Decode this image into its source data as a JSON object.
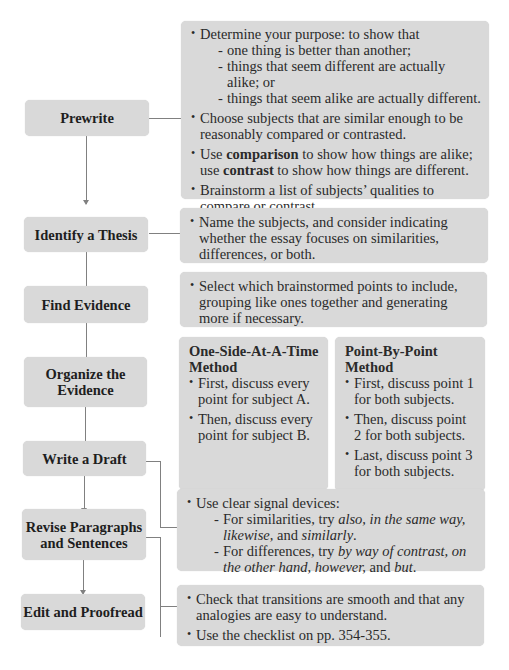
{
  "steps": [
    {
      "id": "prewrite",
      "label": "Prewrite"
    },
    {
      "id": "thesis",
      "label": "Identify a Thesis"
    },
    {
      "id": "evidence",
      "label": "Find Evidence"
    },
    {
      "id": "organize",
      "label_lines": [
        "Organize the",
        "Evidence"
      ]
    },
    {
      "id": "draft",
      "label": "Write a Draft"
    },
    {
      "id": "revise",
      "label_lines": [
        "Revise Paragraphs",
        "and Sentences"
      ]
    },
    {
      "id": "edit",
      "label": "Edit and Proofread"
    }
  ],
  "prewrite_panel": {
    "b1": "Determine your purpose: to show that",
    "b1_subs": [
      "one thing is better than another;",
      "things that seem different are actually alike; or",
      "things that seem alike are actually different."
    ],
    "b2": "Choose subjects that are similar enough to be reasonably compared or contrasted.",
    "b3_pre": "Use ",
    "b3_bold1": "comparison",
    "b3_mid": " to show how things are alike; use ",
    "b3_bold2": "contrast",
    "b3_post": " to show how things are different.",
    "b4": "Brainstorm a list of subjects’ qualities to compare or contrast."
  },
  "thesis_panel": {
    "b1": "Name the subjects, and consider indicating whether the essay focuses on similarities, differences, or both."
  },
  "evidence_panel": {
    "b1": "Select which brainstormed points to include, grouping like ones together and generating more if necessary."
  },
  "organize_panels": {
    "one_side": {
      "title_lines": [
        "One-Side-At-A-Time",
        "Method"
      ],
      "bullets": [
        "First, discuss every point for subject A.",
        "Then, discuss every point for subject B."
      ]
    },
    "point_by_point": {
      "title_lines": [
        "Point-By-Point",
        "Method"
      ],
      "bullets": [
        "First, discuss point 1 for both subjects.",
        "Then, discuss point 2 for both subjects.",
        "Last, discuss point 3 for both subjects."
      ]
    }
  },
  "draft_panel": {
    "b1": "Use clear signal devices:",
    "sub1_pre": "For similarities, try ",
    "sub1_i1": "also, in the same way, likewise,",
    "sub1_mid": " and ",
    "sub1_i2": "similarly",
    "sub1_post": ".",
    "sub2_pre": "For differences, try ",
    "sub2_i1": "by way of contrast, on the other hand, however,",
    "sub2_mid": " and ",
    "sub2_i2": "but",
    "sub2_post": "."
  },
  "revise_panel": {
    "b1": "Check that transitions are smooth and that any analogies are easy to understand.",
    "b2": "Use the checklist on pp. 354-355."
  }
}
